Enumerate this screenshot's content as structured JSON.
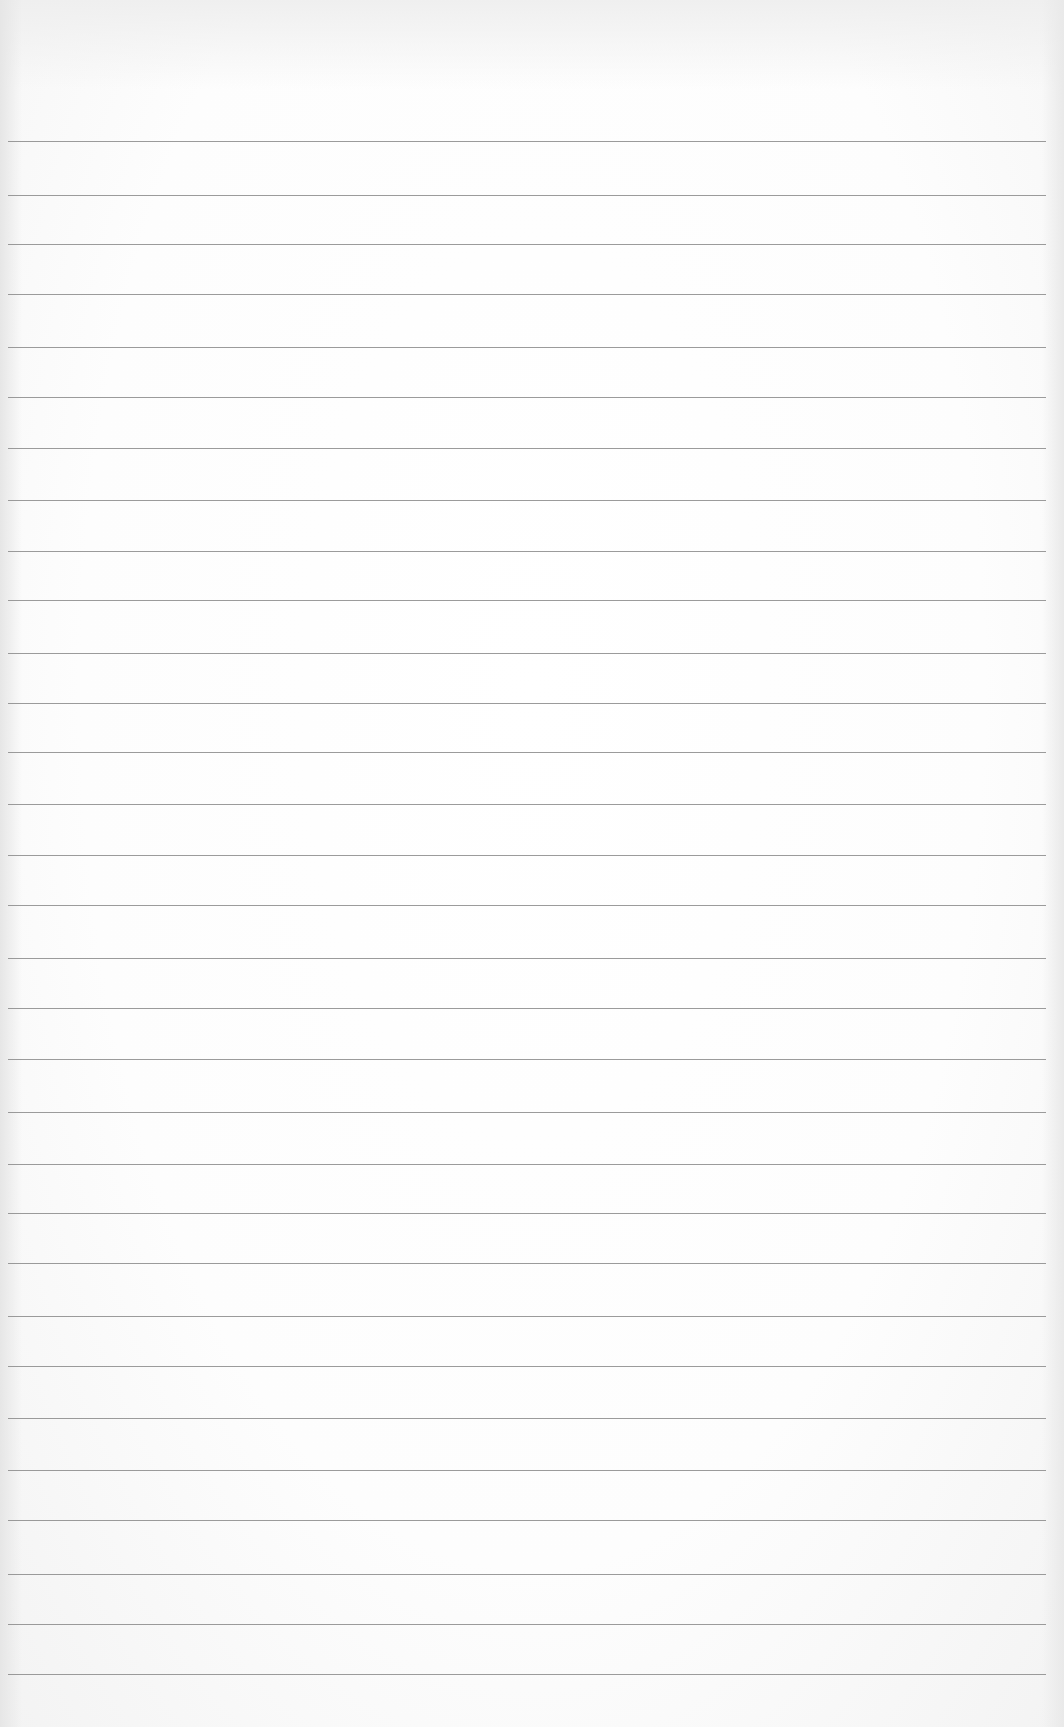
{
  "image": {
    "subject": "blank ruled notebook paper",
    "line_color": "#8a8a8a",
    "paper_color": "#ffffff",
    "rule_count": 31,
    "rule_y_positions": [
      141,
      195,
      244,
      294,
      347,
      397,
      448,
      500,
      551,
      600,
      653,
      703,
      752,
      804,
      855,
      905,
      958,
      1008,
      1059,
      1112,
      1164,
      1213,
      1263,
      1316,
      1366,
      1418,
      1470,
      1520,
      1574,
      1624,
      1674
    ]
  }
}
